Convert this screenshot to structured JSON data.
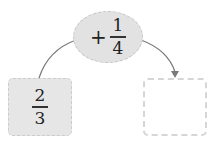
{
  "operation": {
    "operator": "+",
    "fraction": {
      "numerator": "1",
      "denominator": "4"
    }
  },
  "start_box": {
    "fraction": {
      "numerator": "2",
      "denominator": "3"
    }
  },
  "result_box": {
    "value": ""
  },
  "colors": {
    "shape_fill": "#e2e2e2",
    "border": "#c4c4c4",
    "arrow": "#777777"
  }
}
